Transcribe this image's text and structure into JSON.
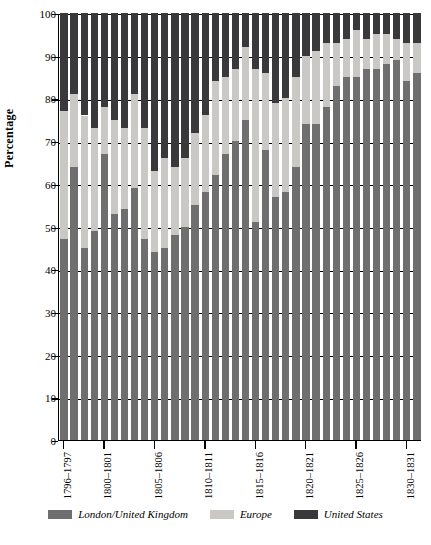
{
  "chart_data": {
    "type": "bar",
    "stacked": true,
    "title": "",
    "xlabel": "",
    "ylabel": "Percentage",
    "ylim": [
      0,
      100
    ],
    "yticks": [
      0,
      10,
      20,
      30,
      40,
      50,
      60,
      70,
      80,
      90,
      100
    ],
    "grid": true,
    "legend_position": "bottom",
    "legend": [
      "London/United Kingdom",
      "Europe",
      "United States"
    ],
    "colors": {
      "London/United Kingdom": "#706f6f",
      "Europe": "#c9c8c4",
      "United States": "#39383a"
    },
    "xtick_labels": [
      "1796–1797",
      "1800–1801",
      "1805–1806",
      "1810–1811",
      "1815–1816",
      "1820–1821",
      "1825–1826",
      "1830–1831"
    ],
    "xtick_indices": [
      0,
      4,
      9,
      14,
      19,
      24,
      29,
      34
    ],
    "categories": [
      "1796–1797",
      "1797–1798",
      "1798–1799",
      "1799–1800",
      "1800–1801",
      "1801–1802",
      "1802–1803",
      "1803–1804",
      "1804–1805",
      "1805–1806",
      "1806–1807",
      "1807–1808",
      "1808–1809",
      "1809–1810",
      "1810–1811",
      "1811–1812",
      "1812–1813",
      "1813–1814",
      "1814–1815",
      "1815–1816",
      "1816–1817",
      "1817–1818",
      "1818–1819",
      "1819–1820",
      "1820–1821",
      "1821–1822",
      "1822–1823",
      "1823–1824",
      "1824–1825",
      "1825–1826",
      "1826–1827",
      "1827–1828",
      "1828–1829",
      "1829–1830",
      "1830–1831",
      "1831–1832"
    ],
    "series": [
      {
        "name": "London/United Kingdom",
        "values": [
          47,
          64,
          45,
          49,
          67,
          53,
          54,
          59,
          47,
          44,
          45,
          48,
          50,
          55,
          58,
          62,
          67,
          70,
          75,
          51,
          68,
          57,
          58,
          64,
          74,
          74,
          78,
          83,
          85,
          85,
          87,
          87,
          88,
          89,
          84,
          86
        ]
      },
      {
        "name": "Europe",
        "values": [
          30,
          17,
          31,
          24,
          11,
          22,
          19,
          22,
          26,
          19,
          21,
          16,
          16,
          17,
          18,
          22,
          18,
          17,
          17,
          36,
          18,
          22,
          22,
          21,
          16,
          17,
          15,
          10,
          9,
          11,
          7,
          8,
          7,
          5,
          9,
          7
        ]
      },
      {
        "name": "United States",
        "values": [
          23,
          19,
          24,
          27,
          22,
          25,
          27,
          19,
          27,
          37,
          34,
          36,
          34,
          28,
          24,
          16,
          15,
          13,
          8,
          13,
          14,
          21,
          20,
          15,
          10,
          9,
          7,
          7,
          6,
          4,
          6,
          5,
          5,
          6,
          7,
          7
        ]
      }
    ]
  },
  "legend_labels": {
    "uk": "London/United Kingdom",
    "eu": "Europe",
    "us": "United States"
  },
  "axis": {
    "ylabel": "Percentage"
  }
}
